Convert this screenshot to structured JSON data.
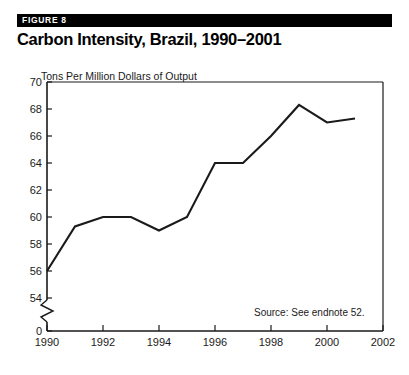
{
  "figure": {
    "badge": "FIGURE 8",
    "title": "Carbon Intensity, Brazil, 1990–2001",
    "source_note": "Source: See endnote 52.",
    "units_label": "Tons Per Million Dollars of Output"
  },
  "colors": {
    "badge_background": "#000000",
    "badge_text": "#ffffff",
    "title": "#000000",
    "axis": "#1a1a1a",
    "series_line": "#1a1a1a",
    "page_background": "#ffffff"
  },
  "chart_data": {
    "type": "line",
    "title": "Carbon Intensity, Brazil, 1990–2001",
    "subtitle": "",
    "xlabel": "",
    "ylabel": "Tons Per Million Dollars of Output",
    "x": [
      1990,
      1991,
      1992,
      1993,
      1994,
      1995,
      1996,
      1997,
      1998,
      1999,
      2000,
      2001
    ],
    "values": [
      56.0,
      59.3,
      60.0,
      60.0,
      59.0,
      60.0,
      64.0,
      64.0,
      66.0,
      68.3,
      67.0,
      67.3
    ],
    "series": [
      {
        "name": "Carbon Intensity",
        "values": [
          56.0,
          59.3,
          60.0,
          60.0,
          59.0,
          60.0,
          64.0,
          64.0,
          66.0,
          68.3,
          67.0,
          67.3
        ]
      }
    ],
    "xlim": [
      1990,
      2002
    ],
    "ylim": [
      54,
      70
    ],
    "y_axis_break": true,
    "y_break_below": 54,
    "y_zero_tick": "0",
    "ytick_labels": [
      "70",
      "68",
      "66",
      "64",
      "62",
      "60",
      "58",
      "56",
      "54",
      "0"
    ],
    "ytick_values": [
      70,
      68,
      66,
      64,
      62,
      60,
      58,
      56,
      54,
      0
    ],
    "xtick_labels": [
      "1990",
      "1992",
      "1994",
      "1996",
      "1998",
      "2000",
      "2002"
    ],
    "xtick_values": [
      1990,
      1992,
      1994,
      1996,
      1998,
      2000,
      2002
    ],
    "grid": false,
    "legend": "none",
    "annotations": [
      "Source: See endnote 52."
    ]
  }
}
